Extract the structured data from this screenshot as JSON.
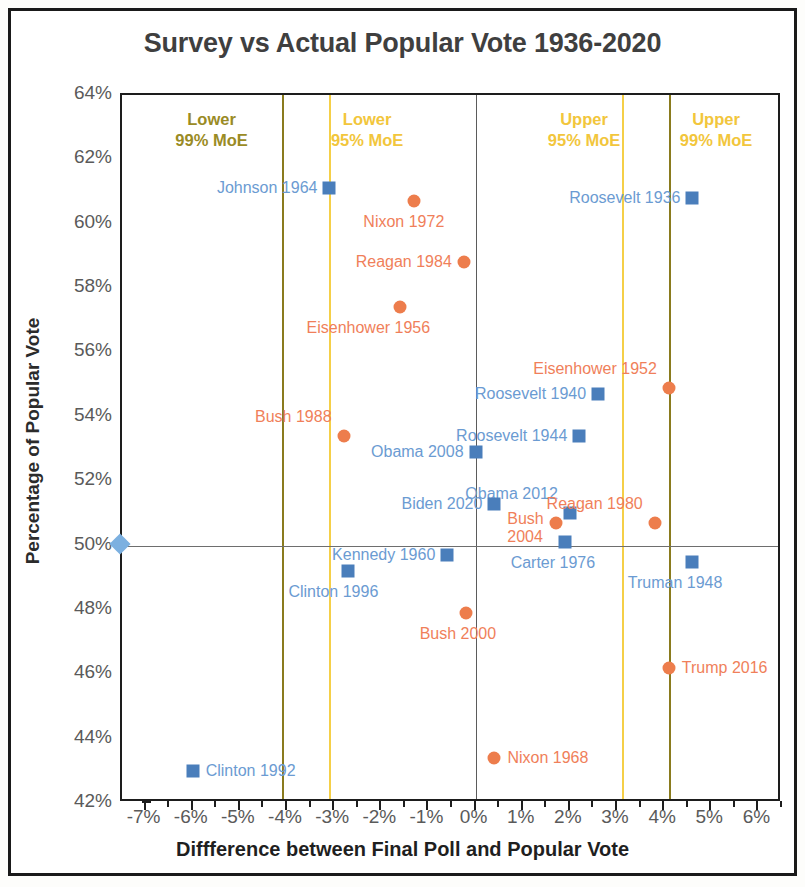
{
  "chart_data": {
    "type": "scatter",
    "title": "Survey vs Actual Popular Vote 1936-2020",
    "xlabel": "Diffference between Final Poll and Popular Vote",
    "ylabel": "Percentage of Popular Vote",
    "xlim": [
      -7.5,
      6.5
    ],
    "ylim": [
      42,
      64
    ],
    "x_ticks": [
      "-7%",
      "-6%",
      "-5%",
      "-4%",
      "-3%",
      "-2%",
      "-1%",
      "0%",
      "1%",
      "2%",
      "3%",
      "4%",
      "5%",
      "6%"
    ],
    "x_tick_values": [
      -7,
      -6,
      -5,
      -4,
      -3,
      -2,
      -1,
      0,
      1,
      2,
      3,
      4,
      5,
      6
    ],
    "y_ticks": [
      "42%",
      "44%",
      "46%",
      "48%",
      "50%",
      "52%",
      "54%",
      "56%",
      "58%",
      "60%",
      "62%",
      "64%"
    ],
    "y_tick_values": [
      42,
      44,
      46,
      48,
      50,
      52,
      54,
      56,
      58,
      60,
      62,
      64
    ],
    "grid": false,
    "legend": "none",
    "reference_lines": {
      "horizontal": [
        {
          "name": "fifty-percent-line",
          "y": 50,
          "color": "#6e6e6e"
        }
      ],
      "vertical": [
        {
          "name": "lower-99-moe",
          "x": -4.1,
          "color": "#8a7b1e"
        },
        {
          "name": "lower-95-moe",
          "x": -3.1,
          "color": "#f5cf47"
        },
        {
          "name": "zero-line",
          "x": 0,
          "color": "#5b5b5b"
        },
        {
          "name": "upper-95-moe",
          "x": 3.1,
          "color": "#f5cf47"
        },
        {
          "name": "upper-99-moe",
          "x": 4.1,
          "color": "#8a7b1e"
        }
      ]
    },
    "zone_labels": [
      {
        "text": "Lower\n99% MoE",
        "x": -5.6,
        "color": "#9a8b25"
      },
      {
        "text": "Lower\n95% MoE",
        "x": -2.3,
        "color": "#f2c63c"
      },
      {
        "text": "Upper\n95% MoE",
        "x": 2.3,
        "color": "#f2c63c"
      },
      {
        "text": "Upper\n99% MoE",
        "x": 5.1,
        "color": "#f2c63c"
      }
    ],
    "series": [
      {
        "name": "Democratic winner",
        "marker": "square",
        "color": "#4a7ebb",
        "label_color": "#6b9bd2",
        "points": [
          {
            "label": "Johnson 1964",
            "x": -3.1,
            "y": 61.1,
            "label_side": "left"
          },
          {
            "label": "Roosevelt 1936",
            "x": 4.6,
            "y": 60.8,
            "label_side": "left"
          },
          {
            "label": "Roosevelt 1940",
            "x": 2.6,
            "y": 54.7,
            "label_side": "left"
          },
          {
            "label": "Roosevelt 1944",
            "x": 2.2,
            "y": 53.4,
            "label_side": "left"
          },
          {
            "label": "Obama 2008",
            "x": 0.0,
            "y": 52.9,
            "label_side": "left"
          },
          {
            "label": "Obama 2012",
            "x": 2.0,
            "y": 51.0,
            "label_side": "above"
          },
          {
            "label": "Biden 2020",
            "x": 0.4,
            "y": 51.3,
            "label_side": "left"
          },
          {
            "label": "Carter 1976",
            "x": 1.9,
            "y": 50.1,
            "label_side": "below"
          },
          {
            "label": "Kennedy 1960",
            "x": -0.6,
            "y": 49.7,
            "label_side": "left"
          },
          {
            "label": "Truman 1948",
            "x": 4.6,
            "y": 49.5,
            "label_side": "below"
          },
          {
            "label": "Clinton 1996",
            "x": -2.7,
            "y": 49.2,
            "label_side": "below"
          },
          {
            "label": "Clinton 1992",
            "x": -6.0,
            "y": 43.0,
            "label_side": "right"
          }
        ]
      },
      {
        "name": "Republican winner",
        "marker": "circle",
        "color": "#ed7d4c",
        "label_color": "#f07f5a",
        "points": [
          {
            "label": "Nixon 1972",
            "x": -1.3,
            "y": 60.7,
            "label_side": "below"
          },
          {
            "label": "Reagan 1984",
            "x": -0.25,
            "y": 58.8,
            "label_side": "left"
          },
          {
            "label": "Eisenhower 1956",
            "x": -1.6,
            "y": 57.4,
            "label_side": "below"
          },
          {
            "label": "Eisenhower 1952",
            "x": 4.1,
            "y": 54.9,
            "label_side": "above"
          },
          {
            "label": "Bush 1988",
            "x": -2.8,
            "y": 53.4,
            "label_side": "above"
          },
          {
            "label": "Reagan 1980",
            "x": 3.8,
            "y": 50.7,
            "label_side": "above"
          },
          {
            "label": "Bush 2004",
            "x": 1.7,
            "y": 50.7,
            "label_side": "left-two"
          },
          {
            "label": "Bush 2000",
            "x": -0.2,
            "y": 47.9,
            "label_side": "below"
          },
          {
            "label": "Trump 2016",
            "x": 4.1,
            "y": 46.2,
            "label_side": "right"
          },
          {
            "label": "Nixon 1968",
            "x": 0.4,
            "y": 43.4,
            "label_side": "right"
          }
        ]
      }
    ],
    "origin_marker": {
      "name": "fifty-percent-origin-diamond",
      "x": -7.5,
      "y": 50,
      "color": "#7cb0e0"
    }
  }
}
